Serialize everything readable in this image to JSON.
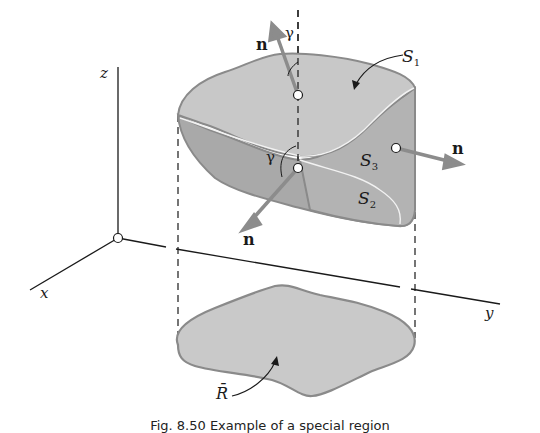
{
  "figure": {
    "axes": {
      "x_label": "x",
      "y_label": "y",
      "z_label": "z"
    },
    "surfaces": {
      "top": {
        "name": "S",
        "sub": "1"
      },
      "bottom": {
        "name": "S",
        "sub": "2"
      },
      "side": {
        "name": "S",
        "sub": "3"
      }
    },
    "region": {
      "label": "R̄"
    },
    "normals": {
      "top": {
        "label": "n",
        "angle_label": "γ"
      },
      "bottom": {
        "label": "n",
        "angle_label": "γ"
      },
      "side": {
        "label": "n"
      }
    },
    "colors": {
      "surface_top": "#c8c8c8",
      "surface_bottom": "#a9a9a9",
      "surface_side": "#b3b3b3",
      "region_fill": "#c9c9c9",
      "outline": "#8a8a8a",
      "arrow": "#8c8c8c",
      "axis": "#1a1a1a"
    },
    "caption": "Fig. 8.50   Example of a special region"
  }
}
